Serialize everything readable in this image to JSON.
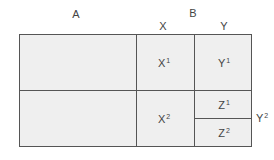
{
  "header_labels": {
    "a": "A",
    "b": "B",
    "x": "X",
    "y": "Y"
  },
  "cells": {
    "x1": {
      "base": "X",
      "sup": "1"
    },
    "y1": {
      "base": "Y",
      "sup": "1"
    },
    "x2": {
      "base": "X",
      "sup": "2"
    },
    "z1": {
      "base": "Z",
      "sup": "1"
    },
    "z2": {
      "base": "Z",
      "sup": "2"
    }
  },
  "side_label": {
    "base": "Y",
    "sup": "2"
  },
  "colors": {
    "fill": "#efefef",
    "line": "#555555",
    "text": "#444444"
  }
}
